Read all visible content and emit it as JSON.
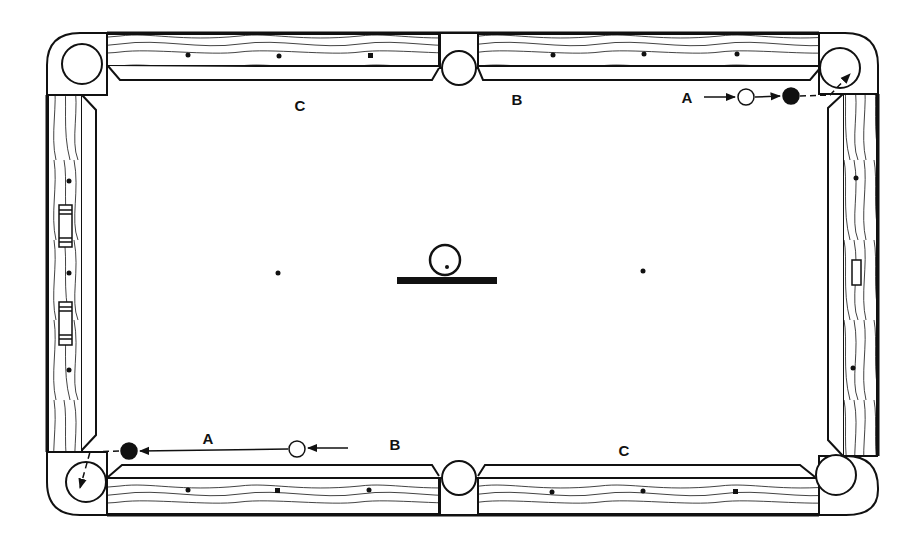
{
  "diagram": {
    "colors": {
      "ink": "#111111",
      "paper": "#ffffff"
    },
    "labels": [
      {
        "id": "top-c",
        "text": "C",
        "x": 300,
        "y": 105
      },
      {
        "id": "top-b",
        "text": "B",
        "x": 517,
        "y": 99
      },
      {
        "id": "top-a",
        "text": "A",
        "x": 687,
        "y": 97
      },
      {
        "id": "bottom-a",
        "text": "A",
        "x": 208,
        "y": 438
      },
      {
        "id": "bottom-b",
        "text": "B",
        "x": 395,
        "y": 444
      },
      {
        "id": "bottom-c",
        "text": "C",
        "x": 624,
        "y": 450
      }
    ],
    "balls": [
      {
        "id": "top-cue-ball",
        "type": "cue",
        "x": 746,
        "y": 97,
        "r": 8
      },
      {
        "id": "top-object-ball",
        "type": "object",
        "x": 791,
        "y": 96,
        "r": 8
      },
      {
        "id": "bottom-cue-ball",
        "type": "cue",
        "x": 297,
        "y": 449,
        "r": 8
      },
      {
        "id": "bottom-object-ball",
        "type": "object",
        "x": 129,
        "y": 451,
        "r": 8
      }
    ],
    "spots": [
      {
        "id": "head-spot",
        "x": 278,
        "y": 273
      },
      {
        "id": "foot-spot",
        "x": 643,
        "y": 271
      }
    ],
    "center_marker": {
      "ball_x": 445,
      "ball_y": 260,
      "ball_r": 15,
      "bar_x": 397,
      "bar_y": 277,
      "bar_w": 100,
      "bar_h": 7
    }
  }
}
